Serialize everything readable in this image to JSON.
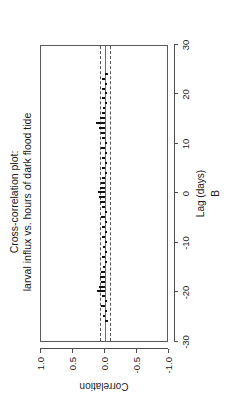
{
  "chart_data": {
    "type": "bar",
    "title": "Cross-correlation plot:",
    "subtitle": "larval influx vs. hours of dark flood tide",
    "title_line1": "Cross-correlation plot:",
    "title_line2": "larval influx vs. hours of dark flood tide",
    "xlabel": "Lag (days)",
    "panel_label": "B",
    "ylabel": "Correlation",
    "xlim": [
      -30,
      30
    ],
    "ylim": [
      -1.0,
      1.0
    ],
    "xticks": [
      -30,
      -20,
      -10,
      0,
      10,
      20,
      30
    ],
    "xticklabels": [
      "-30",
      "-20",
      "-10",
      "0",
      "10",
      "20",
      "30"
    ],
    "yticks": [
      -1.0,
      -0.5,
      0.0,
      0.5,
      1.0
    ],
    "yticklabels": [
      "-1.0",
      "-0.5",
      "0.0",
      "0.5",
      "1.0"
    ],
    "grid": false,
    "legend": "none",
    "rotation_deg": -90,
    "confidence_bounds": [
      -0.085,
      0.085
    ],
    "confidence_line_style": "dashed",
    "zero_line": 0.0,
    "x": [
      -26,
      -25,
      -24,
      -23,
      -22,
      -21,
      -20,
      -19,
      -18,
      -17,
      -16,
      -15,
      -14,
      -13,
      -12,
      -11,
      -10,
      -9,
      -8,
      -7,
      -6,
      -5,
      -4,
      -3,
      -2,
      -1,
      0,
      1,
      2,
      3,
      4,
      5,
      6,
      7,
      8,
      9,
      10,
      11,
      12,
      13,
      14,
      15,
      16,
      17,
      18,
      19,
      20,
      21,
      22,
      23,
      24
    ],
    "values": [
      -0.045,
      0.03,
      -0.02,
      0.055,
      -0.03,
      0.04,
      0.125,
      0.095,
      0.06,
      0.08,
      0.07,
      0.03,
      -0.025,
      0.045,
      -0.02,
      0.035,
      -0.03,
      0.05,
      -0.02,
      0.04,
      -0.035,
      0.055,
      -0.025,
      0.045,
      0.08,
      0.095,
      0.11,
      0.075,
      0.06,
      0.04,
      -0.03,
      0.05,
      -0.025,
      0.04,
      -0.03,
      0.055,
      -0.02,
      0.045,
      0.07,
      0.095,
      0.135,
      0.075,
      0.05,
      0.03,
      -0.025,
      0.04,
      -0.02,
      0.05,
      -0.03,
      0.045,
      -0.04
    ],
    "series_name": "cross-correlation"
  }
}
